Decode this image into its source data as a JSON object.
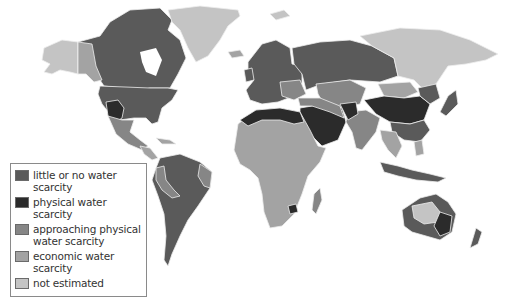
{
  "map": {
    "type": "choropleth world map",
    "colors": {
      "little_or_no": "#5a5a5a",
      "physical": "#2b2b2b",
      "approaching": "#868686",
      "economic": "#a3a3a3",
      "not_estimated": "#c4c4c4",
      "border": "#f0f0f0"
    }
  },
  "legend": {
    "items": [
      {
        "label": "little or no water scarcity",
        "color": "#5a5a5a"
      },
      {
        "label": "physical water scarcity",
        "color": "#2b2b2b"
      },
      {
        "label": "approaching physical water scarcity",
        "color": "#868686"
      },
      {
        "label": "economic water scarcity",
        "color": "#a3a3a3"
      },
      {
        "label": "not estimated",
        "color": "#c4c4c4"
      }
    ]
  }
}
